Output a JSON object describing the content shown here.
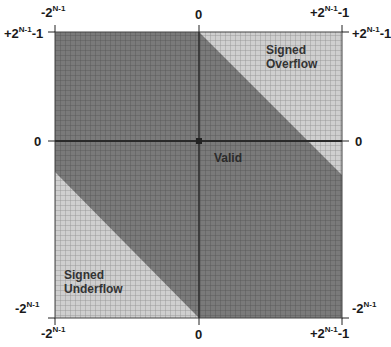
{
  "diagram": {
    "title": "",
    "regions": [
      {
        "name": "Signed Overflow",
        "line1": "Signed",
        "line2": "Overflow",
        "fill": "#c8c8c8"
      },
      {
        "name": "Valid",
        "label": "Valid",
        "fill": "#7a7a7a"
      },
      {
        "name": "Signed Underflow",
        "line1": "Signed",
        "line2": "Underflow",
        "fill": "#c8c8c8"
      }
    ],
    "axes": {
      "top": {
        "left": {
          "base": "-2",
          "exp": "N-1",
          "suffix": ""
        },
        "center": "0",
        "right": {
          "base": "+2",
          "exp": "N-1",
          "suffix": "-1"
        }
      },
      "bottom": {
        "left": {
          "base": "-2",
          "exp": "N-1",
          "suffix": ""
        },
        "center": "0",
        "right": {
          "base": "+2",
          "exp": "N-1",
          "suffix": "-1"
        }
      },
      "left": {
        "top": {
          "base": "+2",
          "exp": "N-1",
          "suffix": "-1"
        },
        "center": "0",
        "bottom": {
          "base": "-2",
          "exp": "N-1",
          "suffix": ""
        }
      },
      "right": {
        "top": {
          "base": "+2",
          "exp": "N-1",
          "suffix": "-1"
        },
        "center": "0",
        "bottom": {
          "base": "-2",
          "exp": "N-1",
          "suffix": ""
        }
      }
    },
    "colors": {
      "valid": "#7a7a7a",
      "overflow": "#c8c8c8",
      "grid_dark": "#555555",
      "grid_light": "#9a9a9a",
      "axis": "#2a2a2a"
    }
  }
}
